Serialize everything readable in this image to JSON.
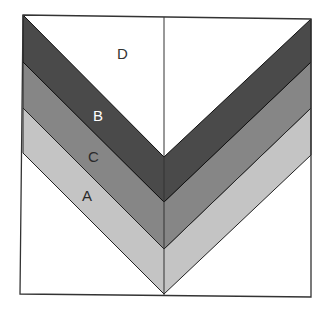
{
  "diagram": {
    "type": "chevron-layer-diagram",
    "layers": [
      {
        "label": "D",
        "color": "#ffffff",
        "text_color": "#333333"
      },
      {
        "label": "B",
        "color": "#4a4a4a",
        "text_color": "#ffffff"
      },
      {
        "label": "C",
        "color": "#868686",
        "text_color": "#2a2a2a"
      },
      {
        "label": "A",
        "color": "#c4c4c4",
        "text_color": "#2a2a2a"
      }
    ],
    "border_color": "#333333",
    "background": "#ffffff"
  }
}
